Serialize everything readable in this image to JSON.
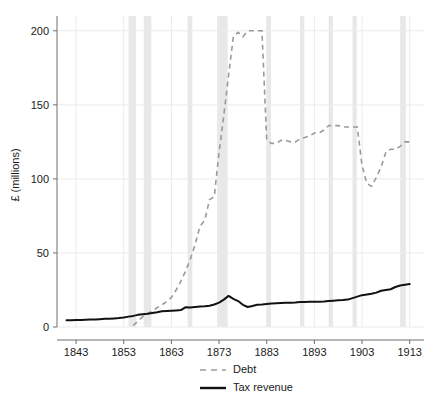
{
  "chart_data": {
    "type": "line",
    "title": "",
    "xlabel": "",
    "ylabel": "£ (millions)",
    "xlim": [
      1839,
      1916
    ],
    "ylim": [
      0,
      210
    ],
    "grid": true,
    "legend_position": "bottom",
    "x_ticks": [
      1843,
      1853,
      1863,
      1873,
      1883,
      1893,
      1903,
      1913
    ],
    "y_ticks": [
      0,
      50,
      100,
      150,
      200
    ],
    "x_tick_labels": [
      "1843",
      "1853",
      "1863",
      "1873",
      "1883",
      "1893",
      "1903",
      "1913"
    ],
    "y_tick_labels": [
      "0",
      "50",
      "100",
      "150",
      "200"
    ],
    "series": [
      {
        "name": "Debt",
        "style": "dashed",
        "color": "#9a9a9a",
        "x": [
          1855,
          1856,
          1857,
          1858,
          1859,
          1860,
          1861,
          1862,
          1863,
          1864,
          1865,
          1866,
          1867,
          1868,
          1869,
          1870,
          1871,
          1872,
          1873,
          1874,
          1875,
          1876,
          1877,
          1878,
          1879,
          1880,
          1881,
          1882,
          1883,
          1884,
          1885,
          1886,
          1887,
          1888,
          1889,
          1890,
          1891,
          1892,
          1893,
          1894,
          1895,
          1896,
          1897,
          1898,
          1899,
          1900,
          1901,
          1902,
          1903,
          1904,
          1905,
          1906,
          1907,
          1908,
          1909,
          1910,
          1911,
          1912,
          1913
        ],
        "values": [
          1,
          4,
          7,
          9,
          11,
          13,
          15,
          17,
          20,
          25,
          31,
          38,
          46,
          56,
          68,
          72,
          86,
          88,
          118,
          143,
          170,
          196,
          199,
          196,
          200,
          200,
          200,
          200,
          126,
          124,
          124,
          126,
          126,
          125,
          125,
          127,
          128,
          129,
          131,
          131,
          133,
          136,
          136,
          136,
          135,
          135,
          135,
          135,
          109,
          97,
          95,
          101,
          108,
          118,
          120,
          120,
          122,
          125,
          125
        ]
      },
      {
        "name": "Tax revenue",
        "style": "solid",
        "color": "#111111",
        "x": [
          1841,
          1842,
          1843,
          1844,
          1845,
          1846,
          1847,
          1848,
          1849,
          1850,
          1851,
          1852,
          1853,
          1854,
          1855,
          1856,
          1857,
          1858,
          1859,
          1860,
          1861,
          1862,
          1863,
          1864,
          1865,
          1866,
          1867,
          1868,
          1869,
          1870,
          1871,
          1872,
          1873,
          1874,
          1875,
          1876,
          1877,
          1878,
          1879,
          1880,
          1881,
          1882,
          1883,
          1884,
          1885,
          1886,
          1887,
          1888,
          1889,
          1890,
          1891,
          1892,
          1893,
          1894,
          1895,
          1896,
          1897,
          1898,
          1899,
          1900,
          1901,
          1902,
          1903,
          1904,
          1905,
          1906,
          1907,
          1908,
          1909,
          1910,
          1911,
          1912,
          1913
        ],
        "values": [
          4.5,
          4.6,
          4.7,
          4.8,
          4.9,
          5.0,
          5.1,
          5.3,
          5.5,
          5.6,
          5.8,
          6.0,
          6.4,
          7.0,
          7.5,
          8.2,
          8.6,
          9.0,
          9.5,
          10.0,
          10.6,
          10.8,
          11.0,
          11.2,
          11.4,
          13.4,
          13.2,
          13.5,
          13.8,
          14.0,
          14.3,
          15.2,
          16.5,
          18.5,
          21.0,
          19.0,
          17.5,
          15.0,
          13.5,
          14.2,
          15.0,
          15.2,
          15.5,
          15.8,
          16.0,
          16.2,
          16.3,
          16.3,
          16.5,
          16.8,
          16.9,
          17.0,
          17.0,
          17.0,
          17.2,
          17.5,
          17.8,
          18.0,
          18.2,
          18.5,
          19.5,
          20.5,
          21.5,
          22.0,
          22.5,
          23.2,
          24.5,
          25.0,
          25.5,
          27.0,
          28.0,
          28.5,
          29.0
        ]
      }
    ],
    "shaded_bands": [
      {
        "start": 1854.0,
        "end": 1855.6
      },
      {
        "start": 1857.2,
        "end": 1858.8
      },
      {
        "start": 1866.4,
        "end": 1867.4
      },
      {
        "start": 1872.6,
        "end": 1874.8
      },
      {
        "start": 1883.0,
        "end": 1883.9
      },
      {
        "start": 1890.0,
        "end": 1890.9
      },
      {
        "start": 1896.0,
        "end": 1896.9
      },
      {
        "start": 1901.0,
        "end": 1901.9
      },
      {
        "start": 1911.0,
        "end": 1912.2
      }
    ],
    "colors": {
      "debt": "#9a9a9a",
      "tax_revenue": "#111111",
      "band": "#e8e8e8",
      "grid": "#ebebeb",
      "axis": "#6e6e6e",
      "text": "#1a1a1a",
      "background": "#ffffff"
    }
  },
  "legend": {
    "items": [
      {
        "label": "Debt",
        "style": "dashed"
      },
      {
        "label": "Tax revenue",
        "style": "solid"
      }
    ]
  }
}
